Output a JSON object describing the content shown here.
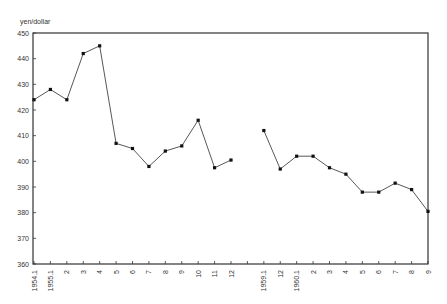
{
  "chart_data": {
    "type": "line",
    "title": "",
    "ylabel": "yen/dollar",
    "xlabel": "",
    "ylim": [
      360,
      450
    ],
    "yticks": [
      360,
      370,
      380,
      390,
      400,
      410,
      420,
      430,
      440,
      450
    ],
    "grid": false,
    "legend": null,
    "categories": [
      "1954.1",
      "1955.1",
      "2",
      "3",
      "4",
      "5",
      "6",
      "7",
      "8",
      "9",
      "10",
      "11",
      "12",
      "",
      "1959.1",
      "12",
      "1960.1",
      "2",
      "3",
      "4",
      "5",
      "6",
      "7",
      "8",
      "9"
    ],
    "series": [
      {
        "name": "yen/dollar",
        "values": [
          424,
          428,
          424,
          442,
          445,
          407,
          405,
          398,
          404,
          406,
          416,
          397.5,
          400.5,
          null,
          412,
          397,
          402,
          402,
          397.5,
          395,
          388,
          388,
          391.5,
          389,
          380.5
        ]
      }
    ]
  },
  "plot": {
    "left": 33,
    "right": 428,
    "top": 33,
    "bottom": 264,
    "line_color": "#444444",
    "marker_color": "#111111"
  }
}
